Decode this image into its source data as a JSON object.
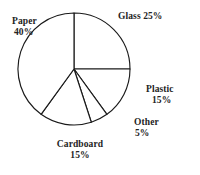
{
  "chart_data": {
    "type": "pie",
    "title": "",
    "subtitle": "",
    "xlabel": "",
    "ylabel": "",
    "legend_position": "none",
    "grid": false,
    "units": "percent",
    "total": 100,
    "categories": [
      "Glass",
      "Plastic",
      "Other",
      "Cardboard",
      "Paper"
    ],
    "values": [
      25,
      15,
      5,
      15,
      40
    ],
    "slices": [
      {
        "name": "Glass",
        "value": 25,
        "value_text": "25%",
        "label_text": "Glass 25%",
        "label_lines": [
          "Glass 25%"
        ],
        "start_angle_deg": 0,
        "end_angle_deg": 90,
        "fill": "#ffffff",
        "stroke": "#1a1a1a"
      },
      {
        "name": "Plastic",
        "value": 15,
        "value_text": "15%",
        "label_text": "Plastic 15%",
        "label_lines": [
          "Plastic",
          "15%"
        ],
        "start_angle_deg": 90,
        "end_angle_deg": 144,
        "fill": "#ffffff",
        "stroke": "#1a1a1a"
      },
      {
        "name": "Other",
        "value": 5,
        "value_text": "5%",
        "label_text": "Other 5%",
        "label_lines": [
          "Other",
          "5%"
        ],
        "start_angle_deg": 144,
        "end_angle_deg": 162,
        "fill": "#ffffff",
        "stroke": "#1a1a1a"
      },
      {
        "name": "Cardboard",
        "value": 15,
        "value_text": "15%",
        "label_text": "Cardboard 15%",
        "label_lines": [
          "Cardboard",
          "15%"
        ],
        "start_angle_deg": 162,
        "end_angle_deg": 216,
        "fill": "#ffffff",
        "stroke": "#1a1a1a"
      },
      {
        "name": "Paper",
        "value": 40,
        "value_text": "40%",
        "label_text": "Paper 40%",
        "label_lines": [
          "Paper",
          "40%"
        ],
        "start_angle_deg": 216,
        "end_angle_deg": 360,
        "fill": "#ffffff",
        "stroke": "#1a1a1a"
      }
    ],
    "geometry": {
      "center_x": 74,
      "center_y": 69,
      "radius": 56
    },
    "colors": {
      "background": "#ffffff",
      "outline": "#1a1a1a",
      "text": "#232323"
    }
  }
}
